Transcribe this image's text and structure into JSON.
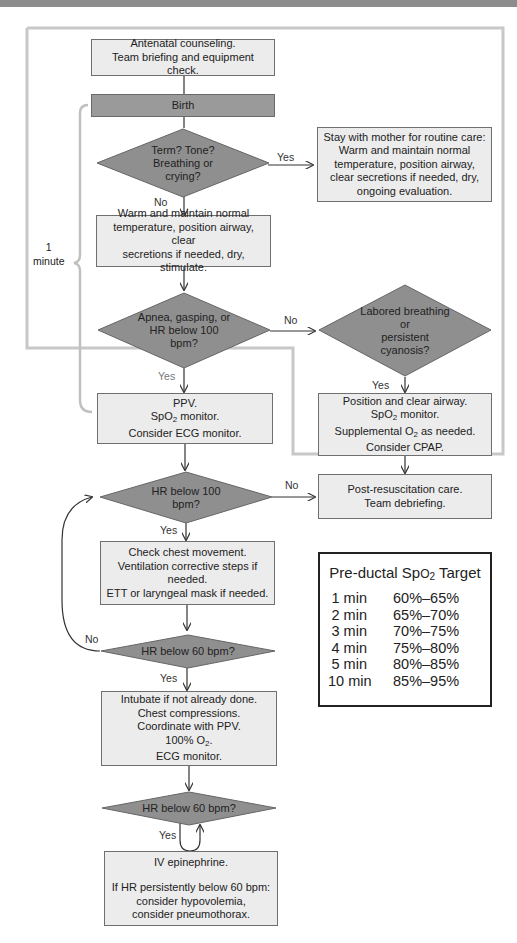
{
  "flowchart": {
    "antenatal": [
      "Antenatal counseling.",
      "Team briefing and equipment check."
    ],
    "birth": "Birth",
    "q_term": [
      "Term? Tone?",
      "Breathing or",
      "crying?"
    ],
    "routine_care": [
      "Stay with mother for routine care:",
      "Warm and maintain normal",
      "temperature, position airway,",
      "clear secretions if needed, dry,",
      "ongoing evaluation."
    ],
    "warm": [
      "Warm and maintain normal",
      "temperature, position airway, clear",
      "secretions if needed, dry, stimulate."
    ],
    "q_apnea": [
      "Apnea, gasping, or",
      "HR below 100",
      "bpm?"
    ],
    "q_labored": [
      "Labored breathing",
      "or",
      "persistent",
      "cyanosis?"
    ],
    "ppv": [
      "PPV.",
      "SpO2 monitor.",
      "Consider ECG monitor."
    ],
    "position_airway": [
      "Position and clear airway.",
      "SpO2 monitor.",
      "Supplemental O2 as needed.",
      "Consider CPAP."
    ],
    "q_hr100": [
      "HR below 100",
      "bpm?"
    ],
    "post_resus": [
      "Post-resuscitation care.",
      "Team debriefing."
    ],
    "check_chest": [
      "Check chest movement.",
      "Ventilation corrective steps if",
      "needed.",
      "ETT or laryngeal mask if needed."
    ],
    "q_hr60_a": "HR below 60 bpm?",
    "intubate": [
      "Intubate if not already done.",
      "Chest compressions.",
      "Coordinate with PPV.",
      "100% O2.",
      "ECG monitor."
    ],
    "q_hr60_b": "HR below 60 bpm?",
    "epinephrine": [
      "IV epinephrine.",
      "",
      "If HR persistently below 60 bpm:",
      "consider hypovolemia,",
      "consider pneumothorax."
    ],
    "labels": {
      "yes": "Yes",
      "no": "No"
    },
    "minute_label": [
      "1",
      "minute"
    ]
  },
  "spo2_target": {
    "title_prefix": "Pre-ductal Sp",
    "title_sub": "O",
    "title_sub2": "2",
    "title_suffix": " Target",
    "rows": [
      {
        "time": "1 min",
        "value": "60%–65%"
      },
      {
        "time": "2 min",
        "value": "65%–70%"
      },
      {
        "time": "3 min",
        "value": "70%–75%"
      },
      {
        "time": "4 min",
        "value": "75%–80%"
      },
      {
        "time": "5 min",
        "value": "80%–85%"
      },
      {
        "time": "10 min",
        "value": "85%–95%"
      }
    ]
  },
  "colors": {
    "box_fill": "#ececec",
    "decision_fill": "#8f8f8f",
    "birth_fill": "#9a9a9a",
    "border_gray": "#c4c4c4"
  }
}
